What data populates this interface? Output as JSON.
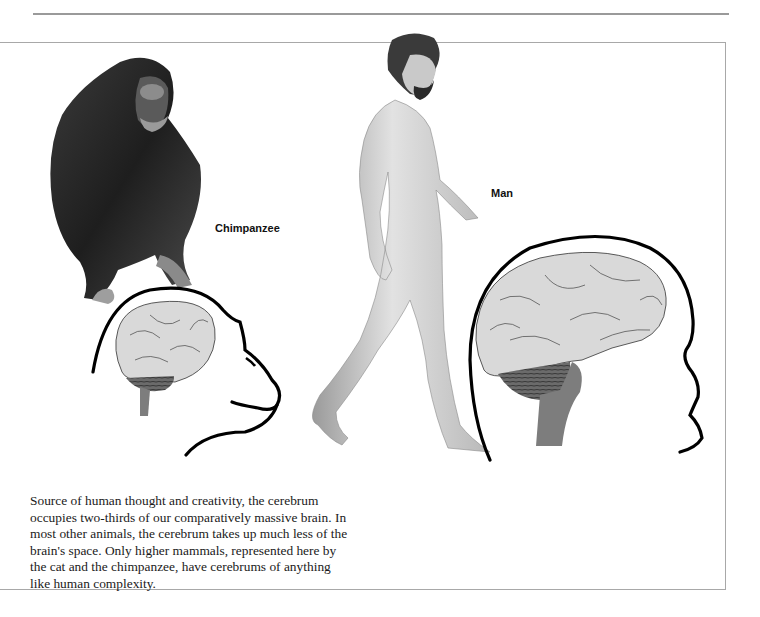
{
  "figure": {
    "labels": {
      "chimpanzee": "Chimpanzee",
      "man": "Man"
    },
    "caption": "Source of human thought and creativity, the cerebrum occupies two-thirds of our comparatively massive brain. In most other animals, the cerebrum takes up much less of the brain's space. Only higher mammals, represented here by the cat and the chimpanzee, have cerebrums of anything like human complexity.",
    "caption_lines": [
      "Source of human thought and creativity, the cerebrum",
      "occupies two-thirds of our comparatively massive brain. In",
      "most other animals, the cerebrum takes up much less of the",
      "brain's space. Only higher mammals, represented here by",
      "the cat and the chimpanzee, have cerebrums of anything",
      "like human complexity."
    ],
    "illustrations": [
      {
        "name": "chimpanzee",
        "description": "seated chimpanzee drawing"
      },
      {
        "name": "chimpanzee-head-outline",
        "description": "head profile with brain"
      },
      {
        "name": "man",
        "description": "walking man drawing"
      },
      {
        "name": "man-head-outline",
        "description": "head profile with brain"
      }
    ],
    "colors": {
      "rule": "#9a9a9a",
      "cerebrum": "#d9d9d9",
      "cerebellum": "#6b6b6b",
      "brainstem": "#7d7d7d",
      "outline": "#000000"
    }
  }
}
